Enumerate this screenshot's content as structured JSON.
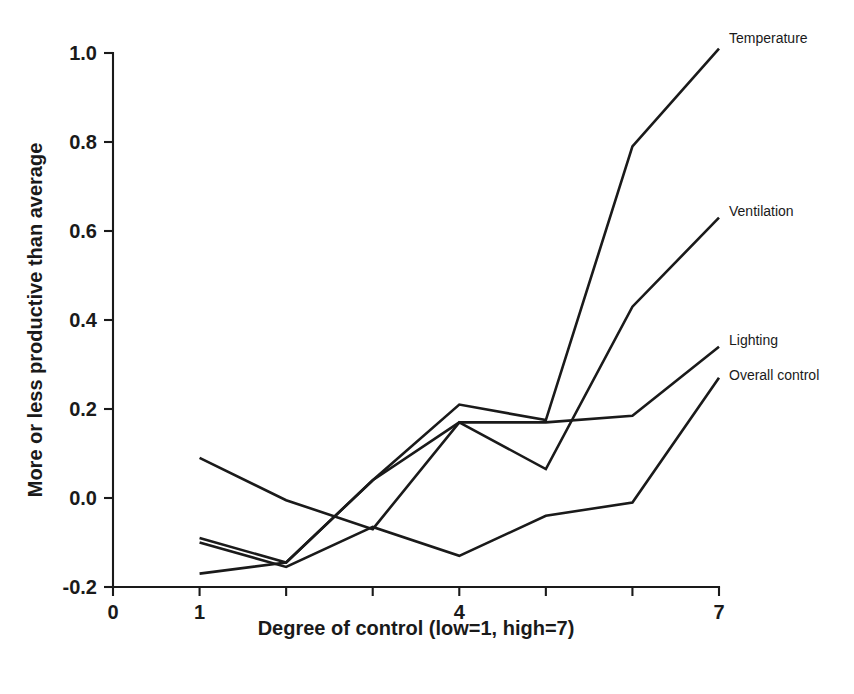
{
  "chart_data": {
    "type": "line",
    "title": "",
    "subtitle": "",
    "xlabel": "Degree of control (low=1, high=7)",
    "ylabel": "More or less productive than average",
    "xlim": [
      0,
      7
    ],
    "ylim": [
      -0.2,
      1.0
    ],
    "grid": false,
    "legend_position": "right-inline-labels",
    "x": [
      1,
      2,
      3,
      4,
      5,
      6,
      7
    ],
    "x_ticks": [
      0,
      1,
      2,
      3,
      4,
      5,
      6,
      7
    ],
    "x_tick_labels": [
      "0",
      "1",
      "",
      "",
      "4",
      "",
      "",
      "7"
    ],
    "y_ticks": [
      -0.2,
      0.0,
      0.2,
      0.4,
      0.6,
      0.8,
      1.0
    ],
    "y_tick_labels": [
      "-0.2",
      "0.0",
      "0.2",
      "0.4",
      "0.6",
      "0.8",
      "1.0"
    ],
    "series": [
      {
        "name": "Temperature",
        "label": "Temperature",
        "color": "#1a1a1a",
        "values": [
          -0.17,
          -0.145,
          0.04,
          0.21,
          0.175,
          0.79,
          1.01
        ]
      },
      {
        "name": "Ventilation",
        "label": "Ventilation",
        "color": "#1a1a1a",
        "values": [
          0.09,
          -0.005,
          -0.07,
          0.17,
          0.065,
          0.43,
          0.63
        ]
      },
      {
        "name": "Lighting",
        "label": "Lighting",
        "color": "#1a1a1a",
        "values": [
          -0.09,
          -0.145,
          0.04,
          0.17,
          0.17,
          0.185,
          0.34
        ]
      },
      {
        "name": "Overall control",
        "label": "Overall control",
        "color": "#1a1a1a",
        "values": [
          -0.1,
          -0.155,
          -0.065,
          -0.13,
          -0.04,
          -0.01,
          0.27
        ]
      }
    ]
  },
  "figure": {
    "background_color": "#ffffff",
    "line_color": "#1a1a1a"
  }
}
